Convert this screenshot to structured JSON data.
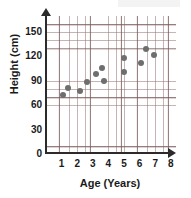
{
  "chart_data": {
    "type": "scatter",
    "title": "",
    "xlabel": "Age (Years)",
    "ylabel": "Height (cm)",
    "xlim": [
      0,
      8.3
    ],
    "ylim": [
      0,
      168
    ],
    "xticks": [
      1,
      2,
      3,
      4,
      5,
      6,
      7,
      8
    ],
    "yticks": [
      0,
      30,
      60,
      90,
      120,
      150
    ],
    "grid": true,
    "legend": "none",
    "marker_color": "#6e6e6e",
    "axis_color": "#2b2b2b",
    "grid_color": "#9a7878",
    "points": [
      {
        "x": 1.1,
        "y": 71
      },
      {
        "x": 1.4,
        "y": 80
      },
      {
        "x": 2.2,
        "y": 76
      },
      {
        "x": 2.6,
        "y": 87
      },
      {
        "x": 3.2,
        "y": 97
      },
      {
        "x": 3.6,
        "y": 105
      },
      {
        "x": 3.7,
        "y": 88
      },
      {
        "x": 5.0,
        "y": 100
      },
      {
        "x": 5.0,
        "y": 117
      },
      {
        "x": 6.1,
        "y": 111
      },
      {
        "x": 6.4,
        "y": 128
      },
      {
        "x": 6.9,
        "y": 121
      }
    ]
  }
}
